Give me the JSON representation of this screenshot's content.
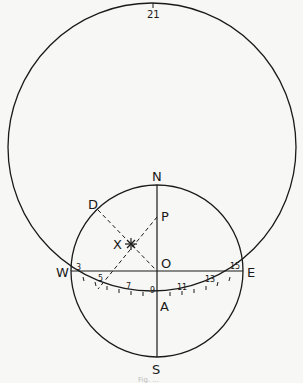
{
  "figure": {
    "outer_circle_label": "21",
    "points": {
      "N": "N",
      "S": "S",
      "E": "E",
      "W": "W",
      "O": "O",
      "P": "P",
      "D": "D",
      "A": "A",
      "X": "X"
    },
    "arc_ticks": [
      "3",
      "5",
      "7",
      "9",
      "11",
      "13",
      "15"
    ],
    "caption": "Fig. ..."
  },
  "colors": {
    "ink": "#1a1a1a",
    "paper": "#f7f7f5"
  }
}
